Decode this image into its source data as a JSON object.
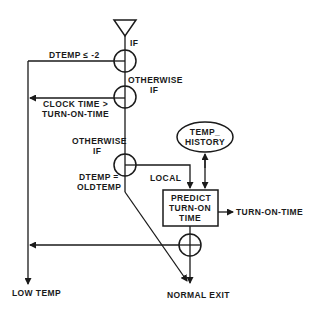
{
  "diagram": {
    "type": "flowchart",
    "entry": {
      "label": "IF"
    },
    "conditions": [
      {
        "id": "c1",
        "label": "DTEMP ≤ -2",
        "target": "low_temp"
      },
      {
        "id": "c2",
        "prefix": "OTHERWISE",
        "prefix2": "IF",
        "label_line1": "CLOCK TIME >",
        "label_line2": "TURN-ON-TIME",
        "target": "low_temp"
      },
      {
        "id": "c3",
        "prefix": "OTHERWISE",
        "prefix2": "IF",
        "label_line1": "DTEMP =",
        "label_line2": "OLDTEMP",
        "target": "normal_exit"
      }
    ],
    "data_store": {
      "line1": "TEMP_",
      "line2": "HISTORY"
    },
    "local_label": "LOCAL",
    "process": {
      "line1": "PREDICT",
      "line2": "TURN-ON",
      "line3": "TIME"
    },
    "output_label": "TURN-ON-TIME",
    "exits": {
      "low_temp": "LOW TEMP",
      "normal_exit": "NORMAL EXIT"
    }
  }
}
